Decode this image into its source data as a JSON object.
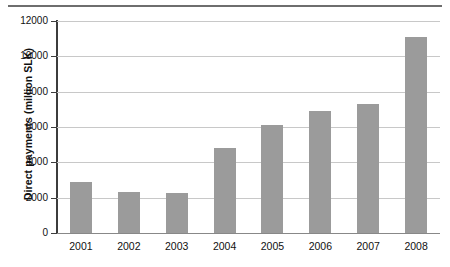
{
  "chart_data": {
    "type": "bar",
    "title": "",
    "xlabel": "",
    "ylabel": "Direct payments (million SLK)",
    "categories": [
      "2001",
      "2002",
      "2003",
      "2004",
      "2005",
      "2006",
      "2007",
      "2008"
    ],
    "values": [
      2900,
      2300,
      2250,
      4800,
      6100,
      6900,
      7300,
      11100
    ],
    "ylim": [
      0,
      12000
    ],
    "ytick_labels": [
      "0",
      "2000",
      "4000",
      "6000",
      "8000",
      "10000",
      "12000"
    ],
    "ytick_values": [
      0,
      2000,
      4000,
      6000,
      8000,
      10000,
      12000
    ],
    "grid": true,
    "legend": "none",
    "bar_color": "#9b9b9b",
    "gridline_color": "#c8c8c8",
    "axis_color": "#3c3c3c",
    "background_color": "#ffffff"
  }
}
